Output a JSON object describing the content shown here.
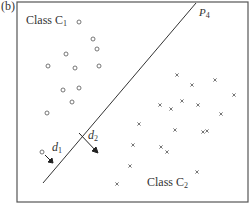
{
  "panel_label": "(b)",
  "class1": {
    "label": "Class C",
    "subscript": "1"
  },
  "class2": {
    "label": "Class C",
    "subscript": "2"
  },
  "plane": {
    "label": "P",
    "subscript": "4"
  },
  "d1": {
    "label": "d",
    "subscript": "1"
  },
  "d2": {
    "label": "d",
    "subscript": "2"
  },
  "colors": {
    "frame": "#555555",
    "marker": "#666666",
    "line": "#333333"
  },
  "class1_points": [
    [
      79,
      22
    ],
    [
      93,
      39
    ],
    [
      97,
      49
    ],
    [
      66,
      54
    ],
    [
      48,
      66
    ],
    [
      75,
      68
    ],
    [
      99,
      66
    ],
    [
      63,
      90
    ],
    [
      79,
      88
    ],
    [
      72,
      102
    ],
    [
      47,
      113
    ],
    [
      42,
      152
    ]
  ],
  "class2_points": [
    [
      177,
      75
    ],
    [
      192,
      85
    ],
    [
      215,
      80
    ],
    [
      234,
      95
    ],
    [
      182,
      101
    ],
    [
      160,
      105
    ],
    [
      171,
      109
    ],
    [
      198,
      105
    ],
    [
      221,
      114
    ],
    [
      175,
      130
    ],
    [
      203,
      132
    ],
    [
      139,
      124
    ],
    [
      133,
      145
    ],
    [
      161,
      147
    ],
    [
      167,
      152
    ],
    [
      130,
      166
    ],
    [
      197,
      172
    ],
    [
      117,
      184
    ],
    [
      207,
      131
    ]
  ],
  "separator_line": {
    "x1": 43,
    "y1": 183,
    "x2": 196,
    "y2": 3
  }
}
